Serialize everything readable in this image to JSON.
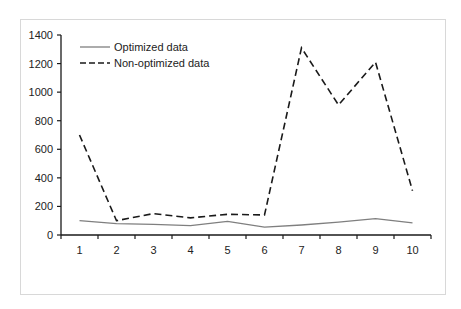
{
  "chart_data": {
    "type": "line",
    "title": "",
    "xlabel": "",
    "ylabel": "",
    "x": [
      1,
      2,
      3,
      4,
      5,
      6,
      7,
      8,
      9,
      10
    ],
    "categories": [
      "1",
      "2",
      "3",
      "4",
      "5",
      "6",
      "7",
      "8",
      "9",
      "10"
    ],
    "ylim": [
      0,
      1400
    ],
    "yticks": [
      0,
      200,
      400,
      600,
      800,
      1000,
      1200,
      1400
    ],
    "grid": false,
    "legend_position": "upper-left",
    "series": [
      {
        "name": "Optimized data",
        "style": "solid",
        "color": "#7f7f7f",
        "values": [
          100,
          80,
          75,
          65,
          95,
          55,
          70,
          90,
          115,
          85
        ]
      },
      {
        "name": "Non-optimized data",
        "style": "dashed",
        "color": "#1a1a1a",
        "values": [
          700,
          100,
          150,
          120,
          145,
          140,
          1310,
          910,
          1210,
          310
        ]
      }
    ]
  },
  "legend": {
    "items": [
      {
        "label": "Optimized data"
      },
      {
        "label": "Non-optimized data"
      }
    ]
  }
}
